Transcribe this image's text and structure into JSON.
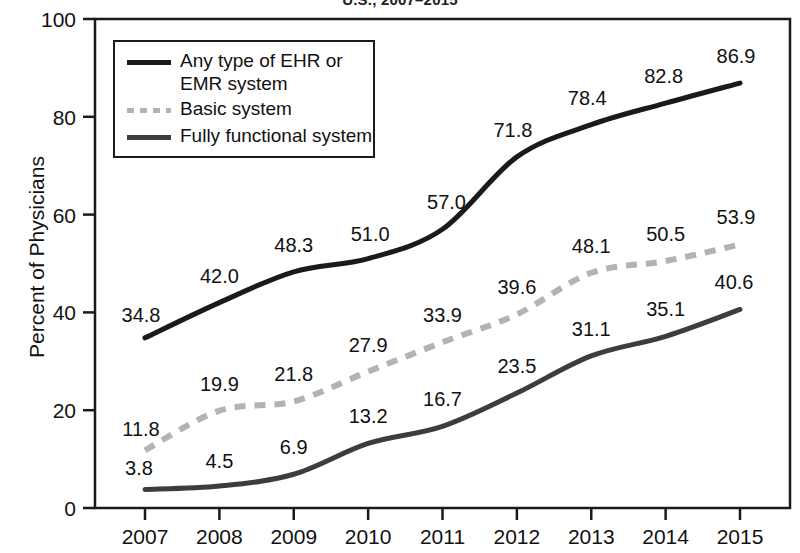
{
  "chart_data": {
    "type": "line",
    "title": "U.S., 2007–2015",
    "xlabel": "",
    "ylabel": "Percent of Physicians",
    "x": [
      2007,
      2008,
      2009,
      2010,
      2011,
      2012,
      2013,
      2014,
      2015
    ],
    "categories": [
      "2007",
      "2008",
      "2009",
      "2010",
      "2011",
      "2012",
      "2013",
      "2014",
      "2015"
    ],
    "ylim": [
      0,
      100
    ],
    "yticks": [
      0,
      20,
      40,
      60,
      80,
      100
    ],
    "ytick_labels": [
      "0",
      "20",
      "40",
      "60",
      "80",
      "100"
    ],
    "grid": false,
    "legend_position": "upper-left",
    "series": [
      {
        "name": "Any type of EHR or EMR system",
        "style": "solid",
        "color": "#1a1a1a",
        "values": [
          34.8,
          42.0,
          48.3,
          51.0,
          57.0,
          71.8,
          78.4,
          82.8,
          86.9
        ],
        "labels": [
          "34.8",
          "42.0",
          "48.3",
          "51.0",
          "57.0",
          "71.8",
          "78.4",
          "82.8",
          "86.9"
        ]
      },
      {
        "name": "Basic system",
        "style": "dashed",
        "color": "#b3b3b3",
        "values": [
          11.8,
          19.9,
          21.8,
          27.9,
          33.9,
          39.6,
          48.1,
          50.5,
          53.9
        ],
        "labels": [
          "11.8",
          "19.9",
          "21.8",
          "27.9",
          "33.9",
          "39.6",
          "48.1",
          "50.5",
          "53.9"
        ]
      },
      {
        "name": "Fully functional system",
        "style": "solid",
        "color": "#3d3d3d",
        "values": [
          3.8,
          4.5,
          6.9,
          13.2,
          16.7,
          23.5,
          31.1,
          35.1,
          40.6
        ],
        "labels": [
          "3.8",
          "4.5",
          "6.9",
          "13.2",
          "16.7",
          "23.5",
          "31.1",
          "35.1",
          "40.6"
        ]
      }
    ]
  },
  "axes": {
    "y_title": "Percent of Physicians",
    "y_ticks": [
      "100",
      "80",
      "60",
      "40",
      "20",
      "0"
    ],
    "x_ticks": [
      "2007",
      "2008",
      "2009",
      "2010",
      "2011",
      "2012",
      "2013",
      "2014",
      "2015"
    ]
  },
  "legend": {
    "items": [
      {
        "label_line1": "Any type of EHR or",
        "label_line2": "EMR system"
      },
      {
        "label_line1": "Basic system",
        "label_line2": ""
      },
      {
        "label_line1": "Fully functional system",
        "label_line2": ""
      }
    ]
  },
  "colors": {
    "any_ehr": "#1a1a1a",
    "basic": "#b3b3b3",
    "fully_functional": "#3d3d3d",
    "axis": "#1a1a1a",
    "background": "#ffffff"
  }
}
